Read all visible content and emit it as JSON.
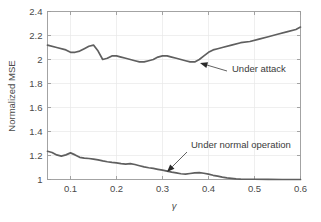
{
  "chart_data": {
    "type": "line",
    "title": "",
    "xlabel": "γ",
    "ylabel": "Normalized MSE",
    "xlim": [
      0.05,
      0.6
    ],
    "ylim": [
      1,
      2.4
    ],
    "grid": true,
    "legend_position": "none",
    "xticks": [
      "0.1",
      "0.2",
      "0.3",
      "0.4",
      "0.5",
      "0.6"
    ],
    "xtick_values": [
      0.1,
      0.2,
      0.3,
      0.4,
      0.5,
      0.6
    ],
    "yticks": [
      "1",
      "1.2",
      "1.4",
      "1.6",
      "1.8",
      "2",
      "2.2",
      "2.4"
    ],
    "ytick_values": [
      1,
      1.2,
      1.4,
      1.6,
      1.8,
      2,
      2.2,
      2.4
    ],
    "series": [
      {
        "name": "Under attack",
        "color": "#5f5f5f",
        "x": [
          0.05,
          0.07,
          0.09,
          0.1,
          0.11,
          0.12,
          0.13,
          0.14,
          0.15,
          0.16,
          0.17,
          0.18,
          0.19,
          0.2,
          0.21,
          0.22,
          0.23,
          0.24,
          0.25,
          0.26,
          0.27,
          0.28,
          0.29,
          0.3,
          0.31,
          0.32,
          0.33,
          0.34,
          0.35,
          0.36,
          0.37,
          0.38,
          0.39,
          0.4,
          0.41,
          0.42,
          0.43,
          0.45,
          0.47,
          0.49,
          0.51,
          0.53,
          0.55,
          0.57,
          0.59,
          0.6
        ],
        "values": [
          2.12,
          2.1,
          2.08,
          2.06,
          2.06,
          2.07,
          2.09,
          2.11,
          2.12,
          2.07,
          2.0,
          2.01,
          2.03,
          2.03,
          2.02,
          2.01,
          2.0,
          1.99,
          1.98,
          1.98,
          1.99,
          2.0,
          2.02,
          2.03,
          2.03,
          2.02,
          2.01,
          2.0,
          1.99,
          1.98,
          1.98,
          2.0,
          2.03,
          2.06,
          2.08,
          2.09,
          2.1,
          2.12,
          2.14,
          2.15,
          2.17,
          2.19,
          2.21,
          2.23,
          2.25,
          2.27
        ]
      },
      {
        "name": "Under normal operation",
        "color": "#5f5f5f",
        "x": [
          0.05,
          0.06,
          0.07,
          0.08,
          0.09,
          0.1,
          0.11,
          0.12,
          0.13,
          0.14,
          0.15,
          0.16,
          0.17,
          0.18,
          0.19,
          0.2,
          0.21,
          0.22,
          0.23,
          0.24,
          0.25,
          0.26,
          0.27,
          0.28,
          0.29,
          0.3,
          0.31,
          0.32,
          0.33,
          0.34,
          0.35,
          0.36,
          0.37,
          0.38,
          0.39,
          0.4,
          0.41,
          0.42,
          0.43,
          0.44,
          0.45,
          0.46,
          0.47,
          0.5,
          0.53,
          0.56,
          0.6
        ],
        "values": [
          1.235,
          1.225,
          1.205,
          1.195,
          1.205,
          1.222,
          1.205,
          1.185,
          1.178,
          1.175,
          1.17,
          1.163,
          1.155,
          1.148,
          1.142,
          1.138,
          1.132,
          1.128,
          1.132,
          1.125,
          1.115,
          1.105,
          1.098,
          1.092,
          1.085,
          1.078,
          1.07,
          1.062,
          1.055,
          1.048,
          1.045,
          1.05,
          1.055,
          1.057,
          1.052,
          1.045,
          1.035,
          1.028,
          1.02,
          1.014,
          1.01,
          1.006,
          1.003,
          1.002,
          1.001,
          1.0,
          1.0
        ]
      }
    ],
    "annotations": [
      {
        "text": "Under attack",
        "text_x": 232,
        "text_y": 72,
        "tip_x": 200,
        "tip_y": 63,
        "tail_x": 227,
        "tail_y": 71
      },
      {
        "text": "Under normal operation",
        "text_x": 191,
        "text_y": 148,
        "tip_x": 167,
        "tip_y": 172,
        "tail_x": 187,
        "tail_y": 152
      }
    ]
  }
}
